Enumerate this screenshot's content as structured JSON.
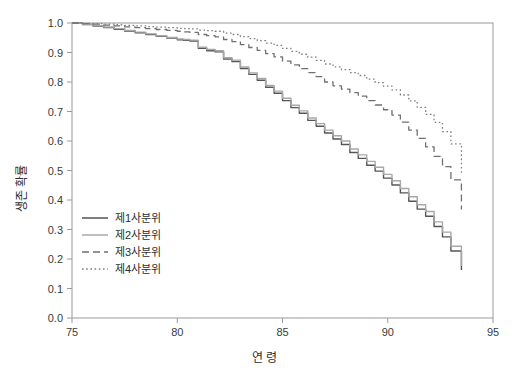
{
  "chart_data": {
    "type": "line",
    "title": "",
    "subtitle": "",
    "xlabel": "연 령",
    "ylabel": "생존 확률",
    "xlim": [
      75,
      95
    ],
    "ylim": [
      0.0,
      1.0
    ],
    "grid": false,
    "legend_position": "inside-lower-left",
    "xticks": [
      "75",
      "80",
      "85",
      "90",
      "95"
    ],
    "xtick_values": [
      75,
      80,
      85,
      90,
      95
    ],
    "yticks": [
      "0.0",
      "0.1",
      "0.2",
      "0.3",
      "0.4",
      "0.5",
      "0.6",
      "0.7",
      "0.8",
      "0.9",
      "1.0"
    ],
    "ytick_values": [
      0.0,
      0.1,
      0.2,
      0.3,
      0.4,
      0.5,
      0.6,
      0.7,
      0.8,
      0.9,
      1.0
    ],
    "x": [
      75.0,
      75.5,
      76.0,
      76.5,
      77.0,
      77.5,
      78.0,
      78.5,
      79.0,
      79.5,
      80.0,
      80.3,
      80.6,
      81.0,
      81.4,
      81.8,
      82.2,
      82.6,
      83.0,
      83.4,
      83.8,
      84.2,
      84.6,
      85.0,
      85.4,
      85.8,
      86.2,
      86.6,
      87.0,
      87.4,
      87.8,
      88.2,
      88.6,
      89.0,
      89.4,
      89.8,
      90.2,
      90.6,
      91.0,
      91.4,
      91.8,
      92.2,
      92.6,
      93.0,
      93.5
    ],
    "series": [
      {
        "name": "제1사분위",
        "style": "solid",
        "color": "#555555",
        "values": [
          1.0,
          0.995,
          0.99,
          0.985,
          0.979,
          0.973,
          0.967,
          0.961,
          0.955,
          0.949,
          0.943,
          0.941,
          0.939,
          0.914,
          0.906,
          0.902,
          0.878,
          0.869,
          0.846,
          0.826,
          0.806,
          0.782,
          0.762,
          0.737,
          0.713,
          0.694,
          0.67,
          0.65,
          0.627,
          0.607,
          0.588,
          0.561,
          0.541,
          0.518,
          0.498,
          0.474,
          0.451,
          0.424,
          0.396,
          0.369,
          0.345,
          0.31,
          0.275,
          0.227,
          0.163
        ]
      },
      {
        "name": "제2사분위",
        "style": "solid",
        "color": "#a8a8a8",
        "values": [
          1.0,
          0.996,
          0.991,
          0.986,
          0.981,
          0.975,
          0.969,
          0.963,
          0.957,
          0.951,
          0.946,
          0.944,
          0.942,
          0.918,
          0.91,
          0.906,
          0.882,
          0.874,
          0.851,
          0.831,
          0.812,
          0.788,
          0.769,
          0.745,
          0.721,
          0.702,
          0.678,
          0.659,
          0.637,
          0.618,
          0.6,
          0.573,
          0.553,
          0.531,
          0.511,
          0.487,
          0.465,
          0.439,
          0.411,
          0.384,
          0.361,
          0.326,
          0.291,
          0.243,
          0.176
        ]
      },
      {
        "name": "제3사분위",
        "style": "dashed",
        "color": "#707070",
        "values": [
          1.0,
          0.998,
          0.996,
          0.993,
          0.99,
          0.987,
          0.984,
          0.981,
          0.978,
          0.975,
          0.972,
          0.97,
          0.968,
          0.961,
          0.957,
          0.953,
          0.944,
          0.937,
          0.927,
          0.917,
          0.907,
          0.896,
          0.885,
          0.871,
          0.858,
          0.845,
          0.832,
          0.818,
          0.8,
          0.787,
          0.776,
          0.764,
          0.752,
          0.737,
          0.722,
          0.706,
          0.688,
          0.664,
          0.637,
          0.609,
          0.58,
          0.548,
          0.513,
          0.468,
          0.368
        ]
      },
      {
        "name": "제4사분위",
        "style": "dotted",
        "color": "#808080",
        "values": [
          1.0,
          0.999,
          0.998,
          0.996,
          0.994,
          0.992,
          0.99,
          0.988,
          0.986,
          0.984,
          0.982,
          0.981,
          0.98,
          0.976,
          0.974,
          0.972,
          0.966,
          0.961,
          0.954,
          0.947,
          0.94,
          0.932,
          0.924,
          0.914,
          0.904,
          0.894,
          0.884,
          0.873,
          0.861,
          0.851,
          0.842,
          0.832,
          0.822,
          0.81,
          0.798,
          0.786,
          0.773,
          0.756,
          0.736,
          0.714,
          0.69,
          0.663,
          0.632,
          0.59,
          0.488
        ]
      }
    ]
  },
  "legend": {
    "items": [
      {
        "label": "제1사분위"
      },
      {
        "label": "제2사분위"
      },
      {
        "label": "제3사분위"
      },
      {
        "label": "제4사분위"
      }
    ]
  },
  "axis": {
    "x_title": "연 령",
    "y_title": "생존 확률"
  }
}
